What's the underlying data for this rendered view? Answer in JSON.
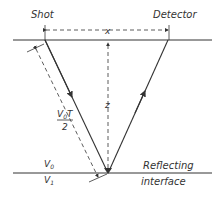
{
  "diagram": {
    "labels": {
      "shot": "Shot",
      "detector": "Detector",
      "offset": "x",
      "depth": "z",
      "path_num": "V",
      "path_num_sub": "0",
      "path_num_t": "T",
      "path_den": "2",
      "v0": "V",
      "v0_sub": "0",
      "v1": "V",
      "v1_sub": "1",
      "reflecting": "Reflecting",
      "interface": "interface"
    },
    "colors": {
      "line": "#333333",
      "background": "#ffffff"
    }
  }
}
